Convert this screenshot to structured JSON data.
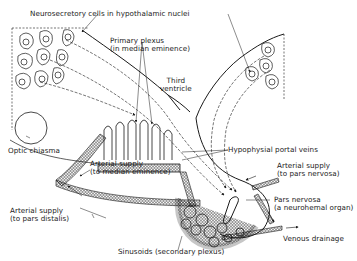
{
  "diagram": {
    "colors": {
      "line": "#1a1a1a",
      "background": "#ffffff"
    },
    "labels": {
      "neurosecretory": "Neurosecretory cells in hypothalamic nuclei",
      "primary_plexus_1": "Primary plexus",
      "primary_plexus_2": "(in median eminence)",
      "third_ventricle_1": "Third",
      "third_ventricle_2": "ventricle",
      "optic_chiasma": "Optic chiasma",
      "arterial_me_1": "Arterial supply",
      "arterial_me_2": "(to median eminence)",
      "portal_veins": "Hypophysial portal veins",
      "arterial_pn_1": "Arterial supply",
      "arterial_pn_2": "(to pars nervosa)",
      "pars_nervosa_1": "Pars nervosa",
      "pars_nervosa_2": "(a neurohemal organ)",
      "arterial_pd_1": "Arterial supply",
      "arterial_pd_2": "(to pars distalis)",
      "venous": "Venous drainage",
      "sinusoids": "Sinusoids (secondary plexus)"
    }
  }
}
